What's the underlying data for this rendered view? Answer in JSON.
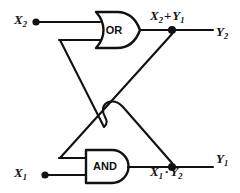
{
  "diagram": {
    "type": "logic-circuit",
    "background_color": "#ffffff",
    "line_color": "#111111",
    "gates": [
      {
        "id": "or-gate",
        "label": "OR",
        "function": "or",
        "inputs": [
          "X_2",
          "Y_1"
        ],
        "output_expression": "X_2 + Y_1",
        "output_name": "Y_2"
      },
      {
        "id": "and-gate",
        "label": "AND",
        "function": "and",
        "inputs": [
          "X_1",
          "Y_2"
        ],
        "output_expression": "X_1 · Y_2",
        "output_name": "Y_1"
      }
    ],
    "inputs": [
      {
        "id": "input-x2",
        "name": "X",
        "subscript": "2"
      },
      {
        "id": "input-x1",
        "name": "X",
        "subscript": "1"
      }
    ],
    "outputs": [
      {
        "id": "output-y2",
        "name": "Y",
        "subscript": "2"
      },
      {
        "id": "output-y1",
        "name": "Y",
        "subscript": "1"
      }
    ],
    "expressions": {
      "or_output": {
        "term1": "X",
        "term1_sub": "2",
        "operator": "+",
        "term2": "Y",
        "term2_sub": "1"
      },
      "and_output": {
        "term1": "X",
        "term1_sub": "1",
        "operator": "·",
        "term2": "Y",
        "term2_sub": "2"
      }
    },
    "gate_labels": {
      "or": "OR",
      "and": "AND"
    }
  }
}
